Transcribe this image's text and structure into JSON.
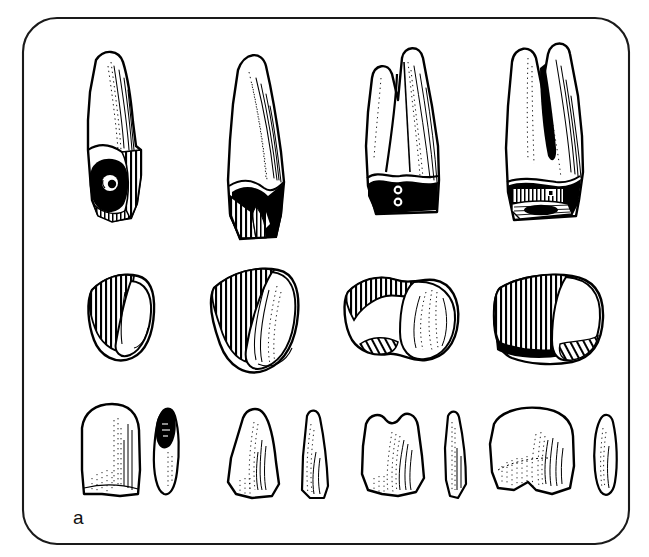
{
  "figure": {
    "domain": "scientific-illustration",
    "panel_label": "a",
    "caption_label_position": "bottom-left",
    "background_color": "#ffffff",
    "ink_color": "#000000",
    "frame": {
      "style": "rounded-rectangle",
      "stroke_color": "#111111",
      "stroke_width_px": 2,
      "corner_radius_px": 34,
      "x": 22,
      "y": 17,
      "width": 608,
      "height": 528
    },
    "layout": {
      "columns": 4,
      "rows": 3,
      "row_labels": [
        "root-and-crown-lateral-view",
        "crown-occlusal-oblique-view",
        "crown-facial-view-with-proximal-profile"
      ],
      "column_labels": [
        "central-incisor",
        "canine",
        "premolar",
        "molar"
      ]
    },
    "rendering": {
      "technique": "pen-and-ink line drawing with hatching and solid black fills",
      "hatch_color": "#000000",
      "fill_color": "#ffffff"
    },
    "specimens": [
      {
        "id": "r1c1",
        "row": 1,
        "column": 1,
        "name": "central-incisor-lateral",
        "view": "lateral / mesial aspect, full root",
        "features": "slender tapering root, hatched shading on distal side, solid black worn cervical area with circular pit"
      },
      {
        "id": "r1c2",
        "row": 1,
        "column": 2,
        "name": "canine-lateral",
        "view": "lateral aspect, full root",
        "features": "long conical root, fine stipple and line shading, dense black band at cervix, vertical hatching on crown"
      },
      {
        "id": "r1c3",
        "row": 1,
        "column": 3,
        "name": "premolar-lateral",
        "view": "buccal aspect, bifurcated root",
        "features": "two divergent root branches, stippled shading, solid black crown base with two small round pits"
      },
      {
        "id": "r1c4",
        "row": 1,
        "column": 4,
        "name": "molar-lateral",
        "view": "buccal aspect, multi-rooted",
        "features": "two roots with deep groove, stippling, black cervical band with hatched occlusal table and black oval fissure"
      },
      {
        "id": "r2c1",
        "row": 2,
        "column": 1,
        "name": "central-incisor-occlusal",
        "view": "occlusal / incisal oblique",
        "features": "triangular hatched facet adjacent to rounded outline"
      },
      {
        "id": "r2c2",
        "row": 2,
        "column": 2,
        "name": "canine-occlusal",
        "view": "occlusal / incisal oblique",
        "features": "wedge-shaped hatched facet with ovoid body and curved internal lines"
      },
      {
        "id": "r2c3",
        "row": 2,
        "column": 3,
        "name": "premolar-occlusal",
        "view": "occlusal oblique",
        "features": "bilobed outline, narrow hatched band along upper edge, hatched notch at lower left"
      },
      {
        "id": "r2c4",
        "row": 2,
        "column": 4,
        "name": "molar-occlusal",
        "view": "occlusal oblique",
        "features": "broad rectangular hatched block with rounded cusp mass at right and hatched lower border"
      },
      {
        "id": "r3c1",
        "row": 3,
        "column": 1,
        "name": "central-incisor-crown",
        "view": "labial face plus proximal profile",
        "features": "broad rounded rectangular crown with vertical stipple shading; narrow leaf profile with black sliver at tip"
      },
      {
        "id": "r3c2",
        "row": 3,
        "column": 2,
        "name": "canine-crown",
        "view": "labial face plus proximal profile",
        "features": "pointed pentagonal crown with cusp tip; narrow blade-like profile"
      },
      {
        "id": "r3c3",
        "row": 3,
        "column": 3,
        "name": "premolar-crown",
        "view": "buccal face plus proximal profile",
        "features": "two-cusped outline with stipple hatching; slender pointed profile"
      },
      {
        "id": "r3c4",
        "row": 3,
        "column": 4,
        "name": "molar-crown",
        "view": "occlusal face plus proximal profile",
        "features": "squarish multi-cusped outline with dense stipple field; lens-shaped profile"
      }
    ]
  }
}
